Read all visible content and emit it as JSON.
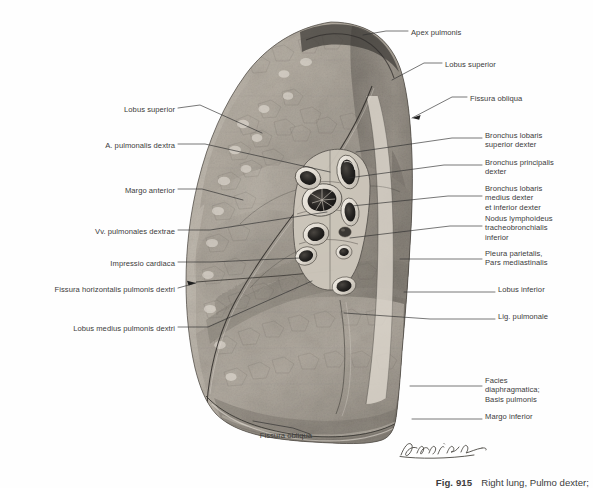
{
  "figure": {
    "number": "Fig. 915",
    "title": "Right lung, Pulmo dexter;",
    "signature": "Lehnier"
  },
  "labels_left": [
    {
      "id": "lobus-superior",
      "text": "Lobus superior",
      "x": 175,
      "y": 111
    },
    {
      "id": "a-pulmonalis-dextra",
      "text": "A. pulmonalis dextra",
      "x": 175,
      "y": 147
    },
    {
      "id": "margo-anterior",
      "text": "Margo anterior",
      "x": 175,
      "y": 192
    },
    {
      "id": "vv-pulmonales-dextrae",
      "text": "Vv. pulmonales dextrae",
      "x": 175,
      "y": 233
    },
    {
      "id": "impressio-cardiaca",
      "text": "Impressio cardiaca",
      "x": 175,
      "y": 265
    },
    {
      "id": "fissura-horizontalis",
      "text": "Fissura horizontalis pulmonis dextri",
      "x": 175,
      "y": 291
    },
    {
      "id": "lobus-medius",
      "text": "Lobus medius pulmonis dextri",
      "x": 175,
      "y": 330
    },
    {
      "id": "fissura-obliqua-inferior",
      "text": "Fissura obliqua",
      "x": 312,
      "y": 437
    }
  ],
  "labels_right": [
    {
      "id": "apex-pulmonis",
      "text": "Apex pulmonis",
      "x": 411,
      "y": 34
    },
    {
      "id": "lobus-superior-right",
      "text": "Lobus superior",
      "x": 445,
      "y": 66
    },
    {
      "id": "fissura-obliqua-superior",
      "text": "Fissura obliqua",
      "x": 470,
      "y": 100
    },
    {
      "id": "bronchus-lobaris-superior-dexter",
      "text": "Bronchus lobaris\nsuperior dexter",
      "x": 485,
      "y": 137
    },
    {
      "id": "bronchus-principalis-dexter",
      "text": "Bronchus principalis\ndexter",
      "x": 485,
      "y": 164
    },
    {
      "id": "bronchus-lobaris-medius",
      "text": "Bronchus lobaris\nmedius dexter\net inferior dexter",
      "x": 485,
      "y": 190
    },
    {
      "id": "nodus-lymphoideus",
      "text": "Nodus lymphoideus\ntracheobronchialis\ninferior",
      "x": 485,
      "y": 220
    },
    {
      "id": "pleura-parietalis",
      "text": "Pleura parietalis,\nPars mediastinalis",
      "x": 485,
      "y": 255
    },
    {
      "id": "lobus-inferior",
      "text": "Lobus inferior",
      "x": 498,
      "y": 291
    },
    {
      "id": "lig-pulmonale",
      "text": "Lig. pulmonale",
      "x": 498,
      "y": 318
    },
    {
      "id": "facies-diaphragmatica",
      "text": "Facies\ndiaphragmatica;\nBasis pulmonis",
      "x": 485,
      "y": 382
    },
    {
      "id": "margo-inferior",
      "text": "Margo inferior",
      "x": 485,
      "y": 418
    }
  ],
  "leaders_left": [
    {
      "id": "leader-lobus-superior",
      "d": "M178,108 L200,105 L262,133"
    },
    {
      "id": "leader-a-pulmonalis",
      "d": "M178,144 L205,144 L330,172"
    },
    {
      "id": "leader-margo-anterior",
      "d": "M178,189 L202,189 L243,200"
    },
    {
      "id": "leader-vv-pulmonales",
      "d": "M178,230 L210,230 L327,212"
    },
    {
      "id": "leader-impressio",
      "d": "M178,262 L212,262 L300,258"
    },
    {
      "id": "leader-fissura-horiz",
      "d": "M178,288 L196,283"
    },
    {
      "id": "leader-lobus-medius",
      "d": "M178,327 L208,327 L312,281"
    },
    {
      "id": "leader-fissura-obliqua-inf",
      "d": "M310,434 L293,428 L253,421"
    }
  ],
  "leaders_right": [
    {
      "id": "leader-apex",
      "d": "M408,31 L386,31 L363,35"
    },
    {
      "id": "leader-lobus-superior-r",
      "d": "M442,63 L424,63 L392,80"
    },
    {
      "id": "leader-fissura-obliqua-s",
      "d": "M467,97 L452,97 L412,118"
    },
    {
      "id": "leader-bronchus-lob-sup",
      "d": "M482,138 L452,138 L356,152"
    },
    {
      "id": "leader-bronchus-princ",
      "d": "M482,165 L444,165 L348,178"
    },
    {
      "id": "leader-bronchus-lob-med",
      "d": "M482,196 L448,196 L352,206"
    },
    {
      "id": "leader-nodus",
      "d": "M482,226 L450,226 L350,238"
    },
    {
      "id": "leader-pleura",
      "d": "M482,259 L452,259 L400,259"
    },
    {
      "id": "leader-lobus-inferior",
      "d": "M495,292 L440,292 L404,292"
    },
    {
      "id": "leader-lig-pulmonale",
      "d": "M495,319 L430,319 L344,313"
    },
    {
      "id": "leader-facies",
      "d": "M482,386 L452,386 L410,386"
    },
    {
      "id": "leader-margo-inferior",
      "d": "M482,419 L450,419 L412,419"
    }
  ],
  "colors": {
    "background": "#fefefe",
    "text": "#3b3b3b",
    "leader": "#2e2e2e",
    "tissue_light": "#d8d2c9",
    "tissue_mid": "#9b968e",
    "tissue_dark": "#59554f",
    "tissue_deep": "#2c2a28"
  },
  "illustration": {
    "alt": "Medial (mediastinal) surface of the right lung, halftone anatomical engraving",
    "regions": [
      "superior lobe",
      "middle lobe",
      "inferior lobe",
      "hilum with cut bronchi, pulmonary artery and veins",
      "cardiac impression",
      "diaphragmatic surface"
    ]
  }
}
